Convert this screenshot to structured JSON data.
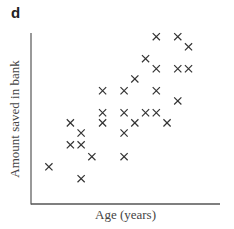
{
  "chart_data": {
    "type": "scatter",
    "panel_label": "d",
    "title": "",
    "xlabel": "Age (years)",
    "ylabel": "Amount saved in bank",
    "grid": false,
    "legend": null,
    "ticks": "none",
    "marker": "x",
    "xlim": [
      0,
      10
    ],
    "ylim": [
      0,
      10
    ],
    "points": [
      {
        "x": 1.0,
        "y": 2.2
      },
      {
        "x": 2.2,
        "y": 4.8
      },
      {
        "x": 2.2,
        "y": 3.5
      },
      {
        "x": 2.8,
        "y": 4.2
      },
      {
        "x": 2.8,
        "y": 3.5
      },
      {
        "x": 2.8,
        "y": 1.5
      },
      {
        "x": 3.4,
        "y": 2.8
      },
      {
        "x": 4.0,
        "y": 6.7
      },
      {
        "x": 4.0,
        "y": 5.4
      },
      {
        "x": 4.0,
        "y": 4.8
      },
      {
        "x": 5.2,
        "y": 6.7
      },
      {
        "x": 5.2,
        "y": 5.4
      },
      {
        "x": 5.2,
        "y": 4.2
      },
      {
        "x": 5.2,
        "y": 2.8
      },
      {
        "x": 5.8,
        "y": 4.8
      },
      {
        "x": 5.8,
        "y": 7.4
      },
      {
        "x": 6.4,
        "y": 8.6
      },
      {
        "x": 6.4,
        "y": 5.4
      },
      {
        "x": 7.0,
        "y": 9.9
      },
      {
        "x": 7.0,
        "y": 8.0
      },
      {
        "x": 7.0,
        "y": 6.7
      },
      {
        "x": 7.0,
        "y": 5.4
      },
      {
        "x": 7.6,
        "y": 4.8
      },
      {
        "x": 8.2,
        "y": 9.9
      },
      {
        "x": 8.2,
        "y": 8.0
      },
      {
        "x": 8.2,
        "y": 6.1
      },
      {
        "x": 8.8,
        "y": 9.3
      },
      {
        "x": 8.8,
        "y": 8.0
      }
    ]
  },
  "colors": {
    "marker": "#333333",
    "axis": "#555555",
    "text": "#444444"
  }
}
